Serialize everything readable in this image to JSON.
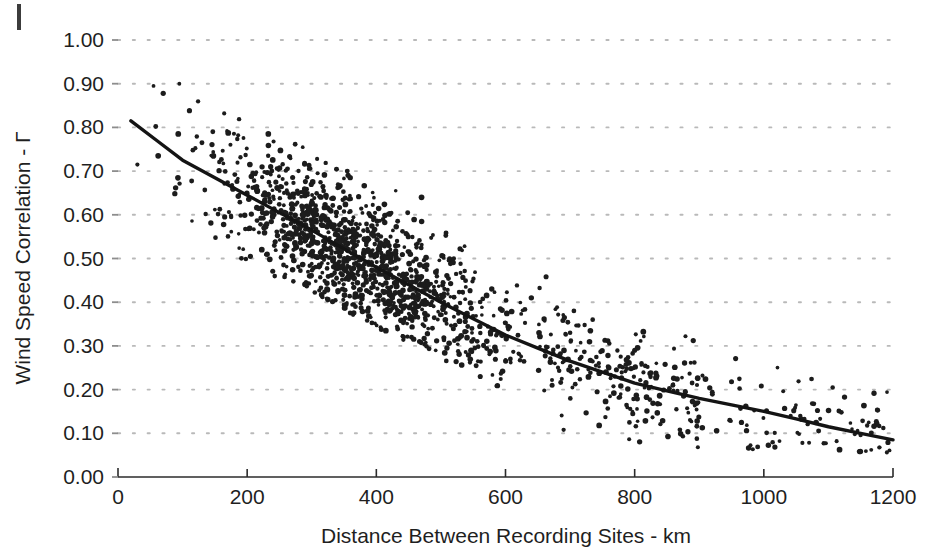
{
  "figure": {
    "margin_mark_name": "page-margin-mark"
  },
  "chart_data": {
    "type": "scatter",
    "title": "",
    "xlabel": "Distance Between Recording Sites - km",
    "ylabel": "Wind Speed Correlation - Γ",
    "xlim": [
      0,
      1200
    ],
    "ylim": [
      0.0,
      1.0
    ],
    "xticks": [
      0,
      200,
      400,
      600,
      800,
      1000,
      1200
    ],
    "xtick_labels": [
      "0",
      "200",
      "400",
      "600",
      "800",
      "1000",
      "1200"
    ],
    "yticks": [
      0.0,
      0.1,
      0.2,
      0.3,
      0.4,
      0.5,
      0.6,
      0.7,
      0.8,
      0.9,
      1.0
    ],
    "ytick_labels": [
      "0.00",
      "0.10",
      "0.20",
      "0.30",
      "0.40",
      "0.50",
      "0.60",
      "0.70",
      "0.80",
      "0.90",
      "1.00"
    ],
    "grid": "horizontal-dotted",
    "legend": "none",
    "marker_color": "#1c1c1c",
    "fit_curve_color": "#141414",
    "series": [
      {
        "name": "Observed site-pair wind speed correlation",
        "type": "scatter",
        "n_points": 1600,
        "marker_size_px": 4.4,
        "description": "Dense cloud of site-pair correlations decaying with separation distance; spread about the fitted decay curve is roughly +/-0.10 at short distances, narrowing slightly at long distances.",
        "scatter_model": {
          "x_distribution": "concentrated between 20 and 700 km, sparse beyond 800 km",
          "mean_curve": "gamma = 0.845 * exp(-distance / 520)",
          "sigma_short": 0.075,
          "sigma_long": 0.055
        },
        "envelope": [
          {
            "x": 20,
            "y_mean": 0.815,
            "y_low": 0.7,
            "y_high": 0.9
          },
          {
            "x": 100,
            "y_mean": 0.725,
            "y_low": 0.62,
            "y_high": 0.86
          },
          {
            "x": 200,
            "y_mean": 0.645,
            "y_low": 0.5,
            "y_high": 0.8
          },
          {
            "x": 300,
            "y_mean": 0.565,
            "y_low": 0.44,
            "y_high": 0.73
          },
          {
            "x": 400,
            "y_mean": 0.48,
            "y_low": 0.36,
            "y_high": 0.63
          },
          {
            "x": 500,
            "y_mean": 0.4,
            "y_low": 0.29,
            "y_high": 0.55
          },
          {
            "x": 600,
            "y_mean": 0.325,
            "y_low": 0.21,
            "y_high": 0.48
          },
          {
            "x": 700,
            "y_mean": 0.265,
            "y_low": 0.14,
            "y_high": 0.42
          },
          {
            "x": 800,
            "y_mean": 0.215,
            "y_low": 0.1,
            "y_high": 0.36
          },
          {
            "x": 900,
            "y_mean": 0.18,
            "y_low": 0.08,
            "y_high": 0.31
          },
          {
            "x": 1000,
            "y_mean": 0.15,
            "y_low": 0.07,
            "y_high": 0.27
          },
          {
            "x": 1100,
            "y_mean": 0.115,
            "y_low": 0.06,
            "y_high": 0.23
          },
          {
            "x": 1200,
            "y_mean": 0.085,
            "y_low": 0.06,
            "y_high": 0.18
          }
        ]
      },
      {
        "name": "Fitted exponential decay curve",
        "type": "line",
        "points": [
          {
            "x": 20,
            "y": 0.815
          },
          {
            "x": 60,
            "y": 0.77
          },
          {
            "x": 100,
            "y": 0.725
          },
          {
            "x": 150,
            "y": 0.685
          },
          {
            "x": 200,
            "y": 0.645
          },
          {
            "x": 250,
            "y": 0.605
          },
          {
            "x": 300,
            "y": 0.565
          },
          {
            "x": 350,
            "y": 0.522
          },
          {
            "x": 400,
            "y": 0.48
          },
          {
            "x": 450,
            "y": 0.44
          },
          {
            "x": 500,
            "y": 0.4
          },
          {
            "x": 550,
            "y": 0.362
          },
          {
            "x": 600,
            "y": 0.325
          },
          {
            "x": 650,
            "y": 0.295
          },
          {
            "x": 700,
            "y": 0.265
          },
          {
            "x": 750,
            "y": 0.24
          },
          {
            "x": 800,
            "y": 0.215
          },
          {
            "x": 850,
            "y": 0.197
          },
          {
            "x": 900,
            "y": 0.18
          },
          {
            "x": 950,
            "y": 0.165
          },
          {
            "x": 1000,
            "y": 0.15
          },
          {
            "x": 1050,
            "y": 0.133
          },
          {
            "x": 1100,
            "y": 0.115
          },
          {
            "x": 1150,
            "y": 0.1
          },
          {
            "x": 1200,
            "y": 0.085
          }
        ]
      }
    ]
  }
}
